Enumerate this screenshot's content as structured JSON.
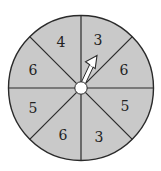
{
  "spinner": {
    "section_count": 8,
    "fill_color": "#c9c9c9",
    "line_color": "#2a2a2a",
    "hub_color": "#ffffff",
    "arrow_color": "#ffffff",
    "sections": [
      {
        "position": "top-left",
        "label": "4"
      },
      {
        "position": "top-right",
        "label": "3"
      },
      {
        "position": "right-upper",
        "label": "6"
      },
      {
        "position": "right-lower",
        "label": "5"
      },
      {
        "position": "bottom-right",
        "label": "3"
      },
      {
        "position": "bottom-left",
        "label": "6"
      },
      {
        "position": "left-lower",
        "label": "5"
      },
      {
        "position": "left-upper",
        "label": "6"
      }
    ],
    "pointer": {
      "points_to": "3"
    }
  }
}
